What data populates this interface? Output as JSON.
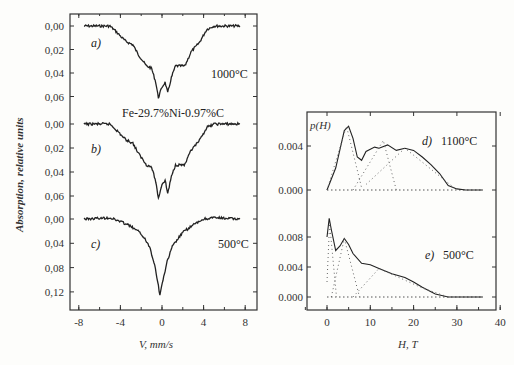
{
  "chart_data": [
    {
      "type": "line",
      "panel": "left",
      "title": "",
      "xlabel": "V, mm/s",
      "ylabel": "Absorption, relative units",
      "xlim": [
        -9,
        9
      ],
      "x_ticks": [
        "-8",
        "-4",
        "0",
        "4",
        "8"
      ],
      "grid": false,
      "compound_label": "Fe-29.7%Ni-0.97%C",
      "series": [
        {
          "name": "a)",
          "annotation": "1000°C",
          "y_ticks": [
            "0.00",
            "0.02",
            "0.04",
            "0.06"
          ],
          "x": [
            -7.5,
            -5,
            -4.5,
            -3.5,
            -2.8,
            -2.3,
            -1.5,
            -1.0,
            -0.6,
            -0.35,
            0.0,
            0.3,
            0.55,
            0.9,
            1.3,
            2.2,
            2.8,
            3.6,
            4.3,
            5.0,
            7.5
          ],
          "values": [
            0.0,
            0.0,
            0.004,
            0.013,
            0.016,
            0.024,
            0.034,
            0.036,
            0.048,
            0.061,
            0.052,
            0.048,
            0.057,
            0.044,
            0.034,
            0.034,
            0.022,
            0.014,
            0.003,
            0.0,
            0.0
          ]
        },
        {
          "name": "b)",
          "y_ticks": [
            "0.00",
            "0.02",
            "0.04",
            "0.06"
          ],
          "x": [
            -7.5,
            -5,
            -4.5,
            -3.5,
            -2.8,
            -2.3,
            -1.5,
            -1.0,
            -0.6,
            -0.35,
            0.0,
            0.3,
            0.55,
            0.9,
            1.3,
            2.2,
            2.8,
            3.6,
            4.3,
            5.0,
            7.5
          ],
          "values": [
            0.0,
            0.0,
            0.004,
            0.013,
            0.016,
            0.024,
            0.034,
            0.036,
            0.048,
            0.062,
            0.05,
            0.047,
            0.058,
            0.044,
            0.034,
            0.034,
            0.022,
            0.014,
            0.003,
            0.0,
            0.0
          ]
        },
        {
          "name": "c)",
          "annotation": "500°C",
          "y_ticks": [
            "0.00",
            "0.04",
            "0.08",
            "0.12"
          ],
          "x": [
            -7.5,
            -5,
            -4,
            -3,
            -2,
            -1.2,
            -0.7,
            -0.35,
            -0.2,
            0.1,
            0.5,
            1.0,
            2.0,
            3.0,
            4.0,
            5.0,
            7.5
          ],
          "values": [
            0.0,
            -0.002,
            0.004,
            0.012,
            0.024,
            0.045,
            0.075,
            0.11,
            0.125,
            0.1,
            0.07,
            0.045,
            0.022,
            0.01,
            0.0,
            -0.002,
            0.0
          ]
        }
      ]
    },
    {
      "type": "line",
      "panel": "right",
      "title": "",
      "xlabel": "H, T",
      "ylabel": "p(H)",
      "xlim": [
        -5,
        40
      ],
      "x_ticks": [
        "0",
        "10",
        "20",
        "30",
        "40"
      ],
      "grid": false,
      "series": [
        {
          "name": "d)",
          "annotation": "1100°C",
          "y_ticks": [
            "0.004",
            "0.000"
          ],
          "x": [
            0,
            2,
            4,
            5,
            6,
            7,
            8,
            9,
            11,
            12,
            14,
            16,
            18,
            20,
            22,
            24,
            26,
            28,
            30,
            32,
            36
          ],
          "values": [
            0.0,
            0.002,
            0.0054,
            0.0058,
            0.0047,
            0.003,
            0.0027,
            0.0035,
            0.0039,
            0.0038,
            0.0041,
            0.0036,
            0.0038,
            0.0036,
            0.003,
            0.0023,
            0.0015,
            0.0004,
            0.0001,
            0.0,
            0.0
          ]
        },
        {
          "name": "e)",
          "annotation": "500°C",
          "y_ticks": [
            "0.008",
            "0.004",
            "0.000"
          ],
          "x": [
            0,
            0.5,
            1,
            2,
            3,
            4,
            5,
            6,
            8,
            10,
            12,
            15,
            18,
            20,
            22,
            25,
            28,
            32,
            36
          ],
          "values": [
            0.008,
            0.0105,
            0.009,
            0.0062,
            0.0068,
            0.0078,
            0.007,
            0.0058,
            0.0045,
            0.0043,
            0.0038,
            0.0031,
            0.0026,
            0.002,
            0.0013,
            0.0004,
            0.0,
            0.0,
            0.0
          ]
        }
      ]
    }
  ],
  "labels": {
    "left_ylabel": "Absorption, relative units",
    "left_xlabel": "V, mm/s",
    "right_xlabel": "H, T",
    "right_ylabel": "p(H)",
    "compound": "Fe-29.7%Ni-0.97%C",
    "a": "a)",
    "b": "b)",
    "c": "c)",
    "d": "d)",
    "e": "e)",
    "t_a": "1000°C",
    "t_c": "500°C",
    "t_d": "1100°C",
    "t_e": "500°C"
  },
  "ticks": {
    "left_x": [
      "-8",
      "-4",
      "0",
      "4",
      "8"
    ],
    "left_y_a": [
      "0.00",
      "0.02",
      "0.04",
      "0.06"
    ],
    "left_y_b": [
      "0.00",
      "0.02",
      "0.04",
      "0.06"
    ],
    "left_y_c": [
      "0.00",
      "0.04",
      "0.08",
      "0.12"
    ],
    "right_x": [
      "0",
      "10",
      "20",
      "30",
      "40"
    ],
    "right_y_d": [
      "0.004",
      "0.000"
    ],
    "right_y_e": [
      "0.008",
      "0.004",
      "0.000"
    ]
  }
}
